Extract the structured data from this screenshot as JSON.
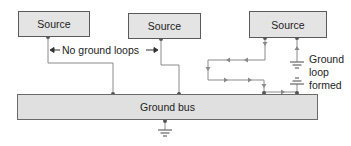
{
  "sources": [
    {
      "label": "Source"
    },
    {
      "label": "Source"
    },
    {
      "label": "Source"
    }
  ],
  "bus": {
    "label": "Ground bus"
  },
  "annotations": {
    "no_loops": "No ground loops",
    "loop_line1": "Ground",
    "loop_line2": "loop",
    "loop_line3": "formed"
  },
  "colors": {
    "wire": "#7a7a7a",
    "node": "#555555",
    "box_fill": "#e4e4e4",
    "text": "#222222"
  }
}
